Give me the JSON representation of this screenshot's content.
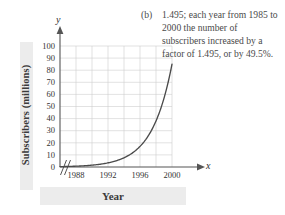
{
  "answer": {
    "label": "(b)",
    "text": "1.495; each year from 1985 to 2000 the number of subscribers increased by a factor of 1.495, or by 49.5%."
  },
  "axes": {
    "y_variable": "y",
    "x_variable": "x",
    "y_title": "Subscribers (millions)",
    "x_title": "Year"
  },
  "chart_data": {
    "type": "line",
    "title": "",
    "subtitle": "",
    "xlabel": "Year",
    "ylabel": "Subscribers (millions)",
    "xlim": [
      1986,
      2000
    ],
    "ylim": [
      0,
      100
    ],
    "x_ticks": [
      1988,
      1992,
      1996,
      2000
    ],
    "y_ticks": [
      0,
      10,
      20,
      30,
      40,
      50,
      60,
      70,
      80,
      90,
      100
    ],
    "grid": true,
    "legend": null,
    "axis_break_x": true,
    "growth_factor": 1.495,
    "growth_percent": "49.5%",
    "series": [
      {
        "name": "Subscribers",
        "color": "#4a4a4a",
        "x": [
          1986,
          1987,
          1988,
          1989,
          1990,
          1991,
          1992,
          1993,
          1994,
          1995,
          1996,
          1997,
          1998,
          1999,
          2000
        ],
        "values": [
          0.4,
          0.6,
          0.9,
          1.3,
          2.0,
          3.0,
          4.4,
          6.6,
          9.9,
          14.8,
          22.1,
          33.0,
          38.2,
          55.3,
          85.0
        ]
      }
    ],
    "annotations": []
  }
}
